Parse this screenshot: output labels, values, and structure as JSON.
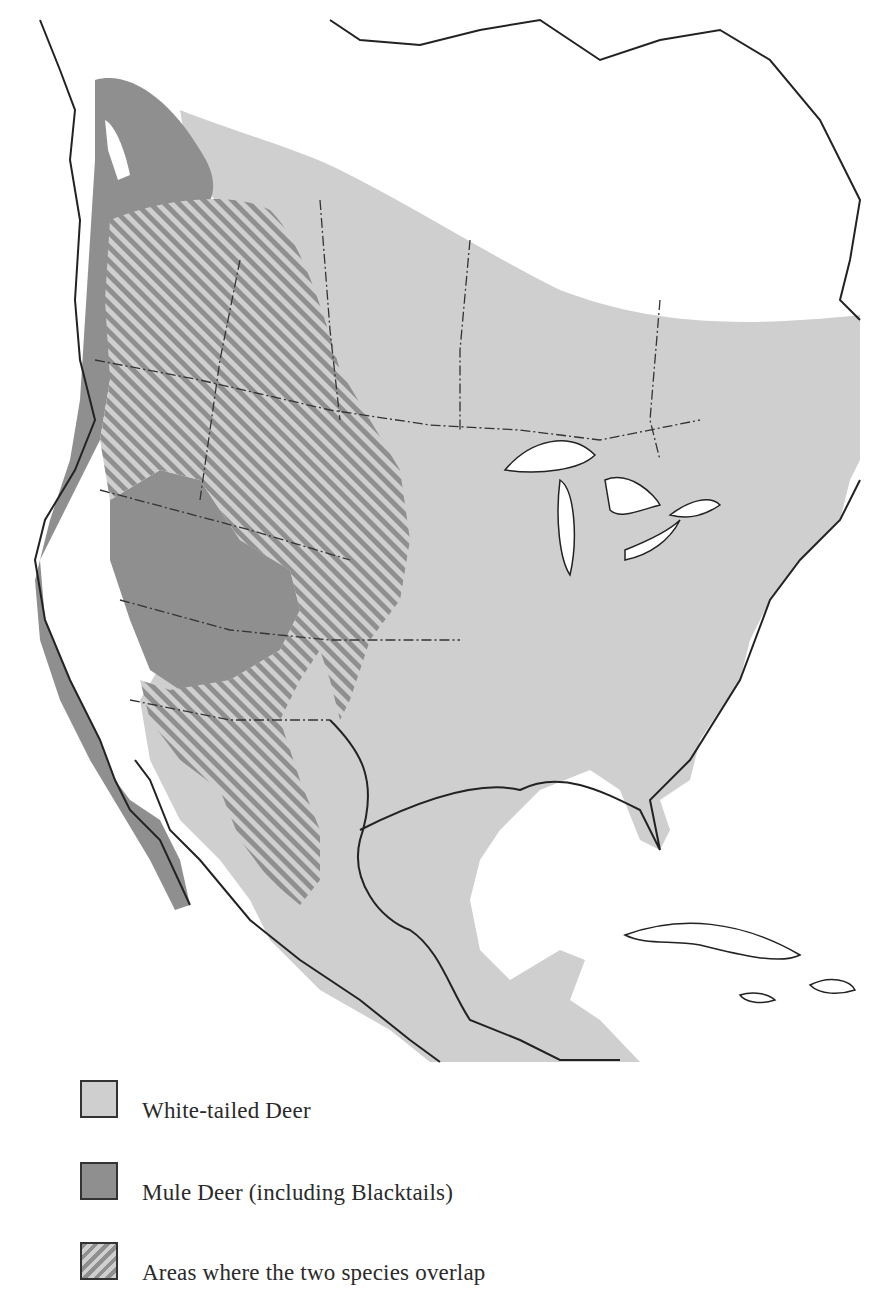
{
  "map": {
    "region": "North America",
    "colors": {
      "white_tailed": "#cfcfcf",
      "mule": "#8f8f8f",
      "overlap_stripe_a": "#8f8f8f",
      "overlap_stripe_b": "#cfcfcf",
      "outline": "#222222",
      "background": "#ffffff"
    }
  },
  "legend": {
    "items": [
      {
        "id": "white-tailed",
        "label": "White-tailed Deer",
        "color": "#cfcfcf",
        "pattern": "solid"
      },
      {
        "id": "mule",
        "label": "Mule Deer (including Blacktails)",
        "color": "#8f8f8f",
        "pattern": "solid"
      },
      {
        "id": "overlap",
        "label": "Areas where the two species overlap",
        "color": "#8f8f8f",
        "pattern": "diagonal-stripes"
      }
    ]
  }
}
